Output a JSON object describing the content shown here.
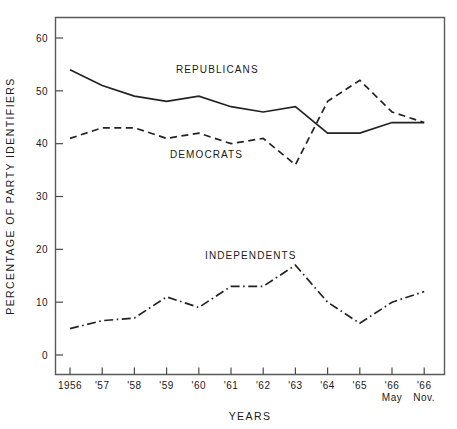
{
  "chart_data": {
    "type": "line",
    "title": "",
    "xlabel": "YEARS",
    "ylabel": "PERCENTAGE OF PARTY IDENTIFIERS",
    "ylim": [
      0,
      63
    ],
    "yticks": [
      0,
      10,
      20,
      30,
      40,
      50,
      60
    ],
    "ytick_labels": [
      "0",
      "10",
      "20",
      "30",
      "40",
      "50",
      "60"
    ],
    "grid": false,
    "legend_position": "inline-annotations",
    "categories": [
      "1956",
      "'57",
      "'58",
      "'59",
      "'60",
      "'61",
      "'62",
      "'63",
      "'64",
      "'65",
      "'66 May",
      "'66 Nov."
    ],
    "xtick_labels": [
      "1956",
      "'57",
      "'58",
      "'59",
      "'60",
      "'61",
      "'62",
      "'63",
      "'64",
      "'65",
      "'66",
      "'66"
    ],
    "xtick_sublabels": [
      "",
      "",
      "",
      "",
      "",
      "",
      "",
      "",
      "",
      "",
      "May",
      "Nov."
    ],
    "series": [
      {
        "name": "REPUBLICANS",
        "style": "solid",
        "values": [
          54,
          51,
          49,
          48,
          49,
          47,
          46,
          47,
          42,
          42,
          44,
          44
        ]
      },
      {
        "name": "DEMOCRATS",
        "style": "dashed",
        "values": [
          41,
          43,
          43,
          41,
          42,
          40,
          41,
          36,
          48,
          52,
          46,
          44
        ]
      },
      {
        "name": "INDEPENDENTS",
        "style": "dash-dot",
        "values": [
          5,
          6.5,
          7,
          11,
          9,
          13,
          13,
          17,
          10,
          6,
          10,
          12
        ]
      }
    ],
    "annotations": [
      {
        "text": "REPUBLICANS",
        "x_px": 176,
        "y_px": 73
      },
      {
        "text": "DEMOCRATS",
        "x_px": 170,
        "y_px": 158
      },
      {
        "text": "INDEPENDENTS",
        "x_px": 205,
        "y_px": 259
      }
    ],
    "colors": {
      "line": "#232323",
      "frame": "#5a5a5a",
      "background": "#ffffff",
      "text": "#1a1a1a"
    }
  }
}
